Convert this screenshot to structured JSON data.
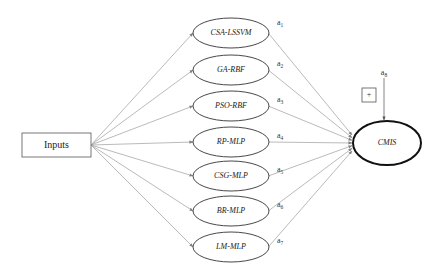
{
  "diagram": {
    "colors": {
      "edge": "#a8a8a8",
      "arrow": "#808080",
      "node_stroke": "#333333",
      "output_stroke": "#111111",
      "text": "#222222"
    },
    "input": {
      "label": "Inputs",
      "x": 22,
      "y": 133,
      "w": 69,
      "h": 24
    },
    "models": [
      {
        "label": "CSA-LSSVM",
        "cy": 33,
        "weight": "a",
        "sub": "1"
      },
      {
        "label": "GA-RBF",
        "cy": 70,
        "weight": "a",
        "sub": "2"
      },
      {
        "label": "PSO-RBF",
        "cy": 106,
        "weight": "a",
        "sub": "3"
      },
      {
        "label": "RP-MLP",
        "cy": 142,
        "weight": "a",
        "sub": "4"
      },
      {
        "label": "CSG-MLP",
        "cy": 176,
        "weight": "a",
        "sub": "5"
      },
      {
        "label": "BR-MLP",
        "cy": 211,
        "weight": "a",
        "sub": "6"
      },
      {
        "label": "LM-MLP",
        "cy": 247,
        "weight": "a",
        "sub": "7"
      }
    ],
    "model_cx": 231,
    "model_rx": 38,
    "model_ry": 15,
    "output": {
      "label": "CMIS",
      "cx": 387,
      "cy": 143,
      "rx": 34,
      "ry": 22
    },
    "bias": {
      "weight": "a",
      "sub": "8",
      "x": 384,
      "y": 75
    },
    "sum_box": {
      "symbol": "+",
      "x": 362,
      "y": 88,
      "size": 14
    }
  }
}
